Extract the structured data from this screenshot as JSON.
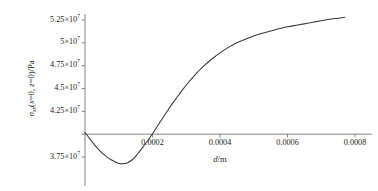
{
  "figure": {
    "background_color": "#ffffff",
    "line_color": "#3a3a3a",
    "axis_color": "#767676"
  },
  "axes": {
    "x_title_var": "d",
    "x_title_unit": "/m",
    "y_title_symbol": "σ",
    "y_title_subscript": "xx",
    "y_title_args": "(x=0, z=0)",
    "y_title_unit": "/Pa",
    "x_ticks": [
      {
        "value": 0.0002,
        "label": "0.0002"
      },
      {
        "value": 0.0004,
        "label": "0.0004"
      },
      {
        "value": 0.0006,
        "label": "0.0006"
      },
      {
        "value": 0.0008,
        "label": "0.0008"
      }
    ],
    "y_ticks": [
      {
        "value": 52500000,
        "mantissa": "5.25",
        "exponent": "7",
        "label": "5.25×10⁷"
      },
      {
        "value": 50000000,
        "mantissa": "5",
        "exponent": "7",
        "label": "5×10⁷"
      },
      {
        "value": 47500000,
        "mantissa": "4.75",
        "exponent": "7",
        "label": "4.75×10⁷"
      },
      {
        "value": 45000000,
        "mantissa": "4.5",
        "exponent": "7",
        "label": "4.5×10⁷"
      },
      {
        "value": 42500000,
        "mantissa": "4.25",
        "exponent": "7",
        "label": "4.25×10⁷"
      },
      {
        "value": 40000000,
        "mantissa": "",
        "exponent": "",
        "label": ""
      },
      {
        "value": 37500000,
        "mantissa": "3.75",
        "exponent": "7",
        "label": "3.75×10⁷"
      }
    ]
  },
  "chart_data": {
    "type": "line",
    "title": "",
    "xlabel": "d/m",
    "ylabel": "σxx(x=0, z=0)/Pa",
    "xlim": [
      0,
      0.00082
    ],
    "ylim": [
      35500000,
      53500000
    ],
    "grid": false,
    "legend": false,
    "axis_crossing_y": 40000000,
    "series": [
      {
        "name": "σxx(x=0, z=0)",
        "x": [
          0.0,
          1.5e-05,
          3e-05,
          4.5e-05,
          6e-05,
          7.5e-05,
          9e-05,
          0.0001,
          0.00011,
          0.000125,
          0.00014,
          0.000155,
          0.00017,
          0.000185,
          0.0002,
          0.000215,
          0.00023,
          0.000245,
          0.00026,
          0.000275,
          0.00029,
          0.000305,
          0.00032,
          0.000335,
          0.00035,
          0.000375,
          0.0004,
          0.000425,
          0.00045,
          0.000475,
          0.0005,
          0.000525,
          0.00055,
          0.000575,
          0.0006,
          0.00063,
          0.00066,
          0.00069,
          0.00072,
          0.00075,
          0.00077
        ],
        "y": [
          40200000,
          39450000,
          38750000,
          38150000,
          37650000,
          37250000,
          36950000,
          36800000,
          36750000,
          36850000,
          37200000,
          37800000,
          38500000,
          39250000,
          40050000,
          40900000,
          41750000,
          42600000,
          43400000,
          44150000,
          44900000,
          45600000,
          46250000,
          46850000,
          47400000,
          48200000,
          48900000,
          49500000,
          50000000,
          50400000,
          50750000,
          51050000,
          51300000,
          51550000,
          51750000,
          51950000,
          52150000,
          52350000,
          52550000,
          52700000,
          52800000
        ]
      }
    ]
  }
}
